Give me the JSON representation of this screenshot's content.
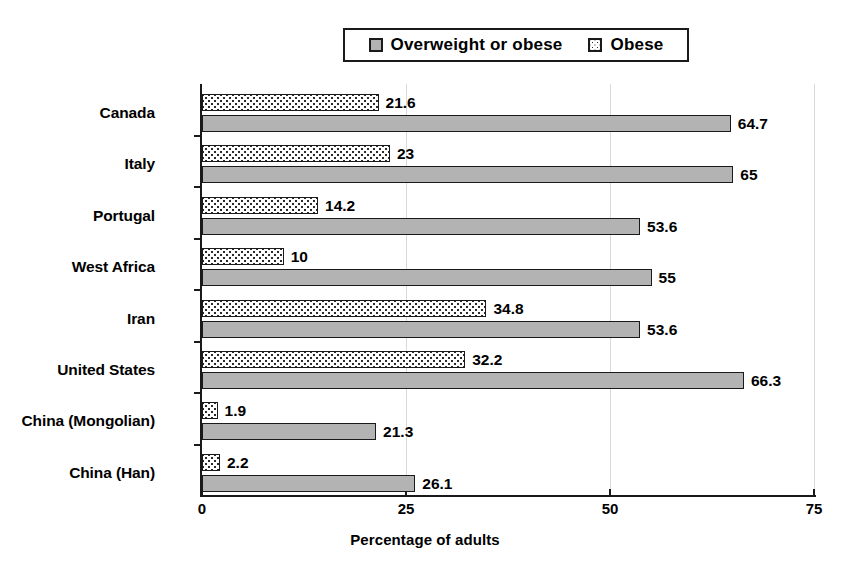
{
  "chart_data": {
    "type": "bar",
    "orientation": "horizontal",
    "title": "",
    "xlabel": "Percentage of adults",
    "ylabel": "",
    "xlim": [
      0,
      75
    ],
    "xticks": [
      0,
      25,
      50,
      75
    ],
    "xtick_labels": [
      "0",
      "25",
      "50",
      "75"
    ],
    "grid": true,
    "grid_axis": "x",
    "legend_position": "top-center",
    "categories": [
      "Canada",
      "Italy",
      "Portugal",
      "West Africa",
      "Iran",
      "United States",
      "China (Mongolian)",
      "China (Han)"
    ],
    "series": [
      {
        "name": "Overweight or obese",
        "pattern": "solid-gray",
        "color": "#b3b3b3",
        "values": [
          64.7,
          65,
          53.6,
          55,
          53.6,
          66.3,
          21.3,
          26.1
        ],
        "value_labels": [
          "64.7",
          "65",
          "53.6",
          "55",
          "53.6",
          "66.3",
          "21.3",
          "26.1"
        ]
      },
      {
        "name": "Obese",
        "pattern": "white-dotted",
        "color": "#ffffff",
        "values": [
          21.6,
          23,
          14.2,
          10,
          34.8,
          32.2,
          1.9,
          2.2
        ],
        "value_labels": [
          "21.6",
          "23",
          "14.2",
          "10",
          "34.8",
          "32.2",
          "1.9",
          "2.2"
        ]
      }
    ]
  },
  "legend": {
    "entries": [
      {
        "label": "Overweight or obese",
        "swatch": "solid-gray-square-icon"
      },
      {
        "label": "Obese",
        "swatch": "dotted-square-icon"
      }
    ]
  },
  "axis": {
    "x_title": "Percentage of adults"
  }
}
